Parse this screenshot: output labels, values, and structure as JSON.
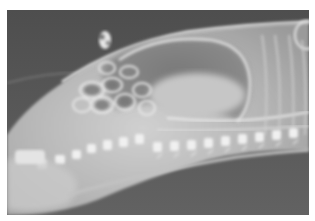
{
  "image": {
    "kind": "radiograph",
    "view": "lateral",
    "subject": "animal body X-ray",
    "colors": {
      "background": "#5a5a5a",
      "border": "#ffffff",
      "soft_tissue": "#b8b8b8",
      "bone": "#f2f2f2",
      "gas_dark": "#6e6e6e"
    }
  }
}
